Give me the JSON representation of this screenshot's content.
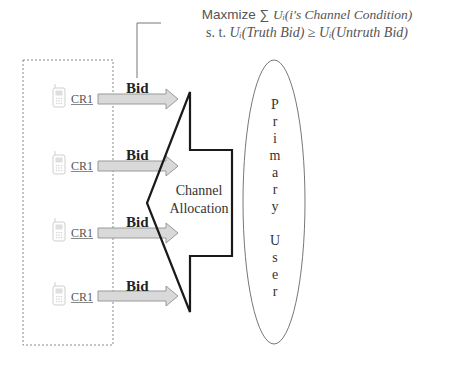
{
  "formula": {
    "line1_prefix": "Maxmize ∑",
    "line1_math": "Uᵢ(i's Channel Condition)",
    "line2_prefix": "s. t.",
    "line2_math": "Uᵢ(Truth Bid) ≥ Uᵢ(Untruth Bid)"
  },
  "cognitive_radios": [
    {
      "label": "CR1",
      "bid_label": "Bid"
    },
    {
      "label": "CR1",
      "bid_label": "Bid"
    },
    {
      "label": "CR1",
      "bid_label": "Bid"
    },
    {
      "label": "CR1",
      "bid_label": "Bid"
    }
  ],
  "channel_allocation": {
    "line1": "Channel",
    "line2": "Allocation"
  },
  "primary_user": {
    "letters": [
      "P",
      "r",
      "i",
      "m",
      "a",
      "r",
      "y",
      "",
      "U",
      "s",
      "e",
      "r"
    ]
  },
  "colors": {
    "arrow_fill": "#d9d9d9",
    "arrow_stroke": "#999999",
    "big_arrow_stroke": "#1a1a1a",
    "dashed_box": "#888888",
    "ellipse_stroke": "#777777",
    "phone": "#cfcfcf"
  }
}
